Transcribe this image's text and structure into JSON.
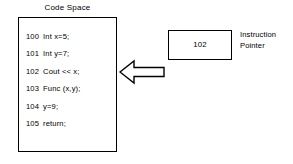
{
  "diagram": {
    "title": "Code Space",
    "colors": {
      "stroke": "#000000",
      "background": "#ffffff",
      "text": "#000000"
    },
    "code_space": {
      "title": "Code Space",
      "lines": [
        {
          "address": "100",
          "source": "Int  x=5;"
        },
        {
          "address": "101",
          "source": "Int  y=7;"
        },
        {
          "address": "102",
          "source": "Cout  << x;"
        },
        {
          "address": "103",
          "source": "Func (x,y);"
        },
        {
          "address": "104",
          "source": "y=9;"
        },
        {
          "address": "105",
          "source": "return;"
        }
      ]
    },
    "arrow": {
      "icon": "left-arrow-icon",
      "direction": "left",
      "style": "hollow-outline"
    },
    "instruction_pointer": {
      "value": "102",
      "label_line_1": "Instruction",
      "label_line_2": "Pointer"
    }
  }
}
